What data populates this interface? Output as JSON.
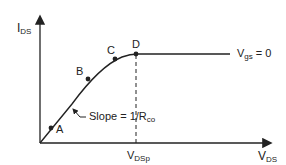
{
  "axes": {
    "y_label_main": "I",
    "y_label_sub": "DS",
    "x_label_main": "V",
    "x_label_sub": "DS"
  },
  "points": [
    {
      "label": "A",
      "x": 51,
      "y": 128
    },
    {
      "label": "B",
      "x": 88,
      "y": 79
    },
    {
      "label": "C",
      "x": 115,
      "y": 59
    },
    {
      "label": "D",
      "x": 135,
      "y": 55
    }
  ],
  "curve_label": {
    "main": "V",
    "sub": "gs",
    "rest": " = 0"
  },
  "slope_label": {
    "text": "Slope = 1/R",
    "sub": "co"
  },
  "vdsp_label": {
    "main": "V",
    "sub": "DSp"
  },
  "colors": {
    "line": "#222222",
    "background": "#ffffff"
  }
}
